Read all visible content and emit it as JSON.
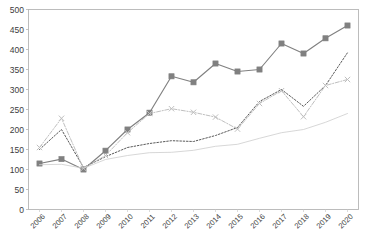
{
  "chart_data": {
    "type": "line",
    "title": "",
    "subtitle": "",
    "xlabel": "",
    "ylabel": "",
    "grid": false,
    "legend_position": "none",
    "categories": [
      "2006",
      "2007",
      "2008",
      "2009",
      "2010",
      "2011",
      "2012",
      "2013",
      "2014",
      "2015",
      "2016",
      "2017",
      "2018",
      "2019",
      "2020"
    ],
    "x": [
      2006,
      2007,
      2008,
      2009,
      2010,
      2011,
      2012,
      2013,
      2014,
      2015,
      2016,
      2017,
      2018,
      2019,
      2020
    ],
    "ylim": [
      0,
      500
    ],
    "yticks": [
      0,
      50,
      100,
      150,
      200,
      250,
      300,
      350,
      400,
      450,
      500
    ],
    "ytick_labels": [
      "0",
      "50",
      "100",
      "150",
      "200",
      "250",
      "300",
      "350",
      "400",
      "450",
      "500"
    ],
    "series": [
      {
        "name": "series-squares",
        "marker": "square",
        "line_style": "solid",
        "color": "#808080",
        "values": [
          115,
          126,
          100,
          147,
          200,
          242,
          333,
          318,
          365,
          345,
          350,
          415,
          390,
          428,
          460
        ]
      },
      {
        "name": "series-dotted",
        "marker": "none",
        "line_style": "dotted",
        "color": "#595959",
        "values": [
          150,
          200,
          105,
          132,
          155,
          165,
          172,
          170,
          185,
          205,
          270,
          300,
          258,
          310,
          392
        ]
      },
      {
        "name": "series-x-markers",
        "marker": "x",
        "line_style": "dash-dot",
        "color": "#bfbfbf",
        "values": [
          155,
          228,
          103,
          135,
          192,
          240,
          252,
          243,
          231,
          201,
          265,
          297,
          232,
          310,
          325
        ]
      },
      {
        "name": "series-thin-line",
        "marker": "none",
        "line_style": "solid-thin",
        "color": "#d0d0d0",
        "values": [
          112,
          113,
          103,
          125,
          135,
          142,
          143,
          148,
          158,
          163,
          178,
          192,
          200,
          218,
          240
        ]
      }
    ]
  },
  "axes": {
    "y_axis_name": "y-axis",
    "x_axis_name": "x-axis"
  }
}
